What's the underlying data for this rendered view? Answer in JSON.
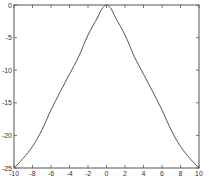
{
  "chart_data": {
    "type": "line",
    "title": "",
    "xlabel": "",
    "ylabel": "",
    "xlim": [
      -10,
      10
    ],
    "ylim": [
      -25,
      0
    ],
    "grid": false,
    "legend": null,
    "x_ticks": [
      -10,
      -8,
      -6,
      -4,
      -2,
      0,
      2,
      4,
      6,
      8,
      10
    ],
    "y_ticks": [
      0,
      -5,
      -10,
      -15,
      -20,
      -25
    ],
    "series": [
      {
        "name": "curve",
        "color": "#555555",
        "x": [
          -10,
          -9,
          -8,
          -7,
          -6,
          -5,
          -4,
          -3,
          -2,
          -1,
          -0.5,
          0,
          0.5,
          1,
          2,
          3,
          4,
          5,
          6,
          7,
          8,
          9,
          10
        ],
        "y": [
          -25,
          -23.5,
          -21.7,
          -19.2,
          -16.1,
          -13.3,
          -10.6,
          -7.9,
          -4.6,
          -2.0,
          -0.6,
          0,
          -0.6,
          -2.0,
          -4.6,
          -7.9,
          -10.6,
          -13.3,
          -16.1,
          -19.2,
          -21.7,
          -23.5,
          -25
        ]
      }
    ]
  },
  "colors": {
    "axes": "#555555",
    "line": "#555555",
    "background": "#ffffff"
  }
}
